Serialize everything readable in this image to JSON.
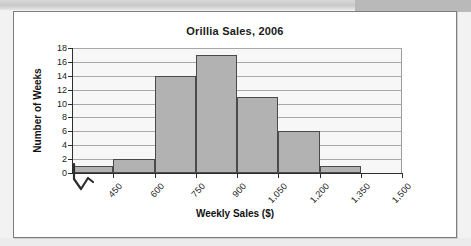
{
  "chart_data": {
    "type": "bar",
    "title": "Orillia Sales, 2006",
    "xlabel": "Weekly Sales ($)",
    "ylabel": "Number of Weeks",
    "categories": [
      "450",
      "600",
      "750",
      "900",
      "1,050",
      "1,200",
      "1,350",
      "1,500"
    ],
    "values": [
      1,
      2,
      14,
      17,
      11,
      6,
      1,
      0
    ],
    "ylim": [
      0,
      18
    ],
    "yticks": [
      0,
      2,
      4,
      6,
      8,
      10,
      12,
      14,
      16,
      18
    ],
    "xtick_labels": [
      "450",
      "600",
      "750",
      "900",
      "1,050",
      "1,200",
      "1,350",
      "1,500"
    ],
    "grid": true,
    "legend": "none",
    "bar_color": "#b2b2b2",
    "bar_border_color": "#4a4a4a",
    "plot_background": "#f7f7f7",
    "gridline_color": "#a8a8a8",
    "axis_color": "#2e2e2e",
    "axis_break_symbol": "zigzag"
  },
  "panel": {
    "border_color": "#7d7d7d",
    "background": "#ffffff"
  },
  "icons": {
    "axis_break": "axis-break-zigzag-icon"
  }
}
